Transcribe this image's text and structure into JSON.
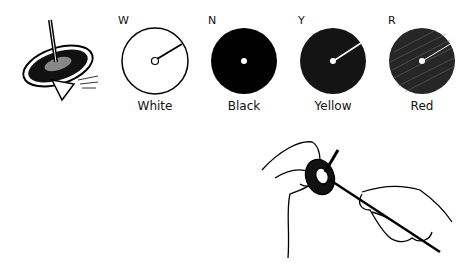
{
  "figure": {
    "discs": [
      {
        "letter": "W",
        "label": "White",
        "fill": "#ffffff"
      },
      {
        "letter": "N",
        "label": "Black",
        "fill": "#000000"
      },
      {
        "letter": "Y",
        "label": "Yellow",
        "fill": "#161616"
      },
      {
        "letter": "R",
        "label": "Red",
        "fill": "#2a2a2a"
      }
    ],
    "illustrations": [
      {
        "name": "spinning-top"
      },
      {
        "name": "hands-fitting-disc-onto-top"
      }
    ]
  }
}
